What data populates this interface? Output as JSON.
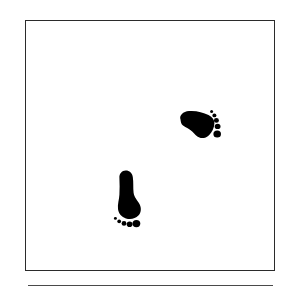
{
  "figure": {
    "title": "",
    "background_color": "#ffffff",
    "frame": {
      "name": "square-border-frame",
      "stroke_color": "#2b2b2b",
      "stroke_width_px": 1.5,
      "x": 25,
      "y": 20,
      "width": 250,
      "height": 251
    },
    "rule": {
      "name": "horizontal-rule",
      "stroke_color": "#4a4a4a",
      "stroke_width_px": 1.6,
      "x": 28,
      "y": 285,
      "width": 245
    },
    "footprints": [
      {
        "id": "upper-footprint",
        "side": "right",
        "label": "right-foot-print",
        "fill_color": "#000000",
        "rotation_deg": 90,
        "toe_count": 5,
        "bbox": {
          "x": 178,
          "y": 109,
          "width": 44,
          "height": 36
        },
        "orientation": "toes-pointing-right"
      },
      {
        "id": "lower-footprint",
        "side": "left",
        "label": "left-foot-print",
        "fill_color": "#000000",
        "rotation_deg": 0,
        "toe_count": 5,
        "bbox": {
          "x": 114,
          "y": 170,
          "width": 36,
          "height": 59
        },
        "orientation": "toes-pointing-down"
      }
    ]
  }
}
